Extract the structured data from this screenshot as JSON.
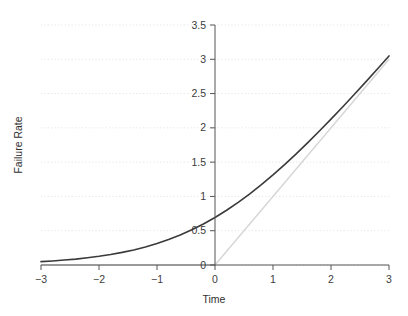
{
  "chart_data": {
    "type": "line",
    "title": "",
    "xlabel": "Time",
    "ylabel": "Failure Rate",
    "xlim": [
      -3,
      3
    ],
    "ylim": [
      0,
      3.5
    ],
    "grid": true,
    "grid_axis": "y",
    "legend": "none",
    "xticks": [
      -3,
      -2,
      -1,
      0,
      1,
      2,
      3
    ],
    "xticklabels": [
      "−3",
      "−2",
      "−1",
      "0",
      "1",
      "2",
      "3"
    ],
    "yticks": [
      0,
      0.5,
      1,
      1.5,
      2,
      2.5,
      3,
      3.5
    ],
    "yticklabels": [
      "0",
      "0.5",
      "1",
      "1.5",
      "2",
      "2.5",
      "3",
      "3.5"
    ],
    "y_axis_position_x": 0,
    "series": [
      {
        "name": "softplus",
        "color": "#3a3a3a",
        "width": 1.6,
        "x": [
          -3,
          -2.8,
          -2.6,
          -2.4,
          -2.2,
          -2,
          -1.8,
          -1.6,
          -1.4,
          -1.2,
          -1,
          -0.8,
          -0.6,
          -0.4,
          -0.2,
          0,
          0.2,
          0.4,
          0.6,
          0.8,
          1,
          1.2,
          1.4,
          1.6,
          1.8,
          2,
          2.2,
          2.4,
          2.6,
          2.8,
          3
        ],
        "values": [
          0.049,
          0.059,
          0.072,
          0.086,
          0.105,
          0.127,
          0.153,
          0.184,
          0.22,
          0.263,
          0.313,
          0.371,
          0.438,
          0.513,
          0.598,
          0.693,
          0.798,
          0.913,
          1.038,
          1.171,
          1.313,
          1.463,
          1.62,
          1.784,
          1.954,
          2.127,
          2.305,
          2.487,
          2.671,
          2.858,
          3.049
        ]
      },
      {
        "name": "relu",
        "color": "#d6d6d6",
        "width": 1.4,
        "x": [
          -3,
          0,
          3
        ],
        "values": [
          0,
          0,
          3
        ]
      }
    ],
    "annotations": []
  },
  "axis": {
    "x_title": "Time",
    "y_title": "Failure Rate"
  }
}
